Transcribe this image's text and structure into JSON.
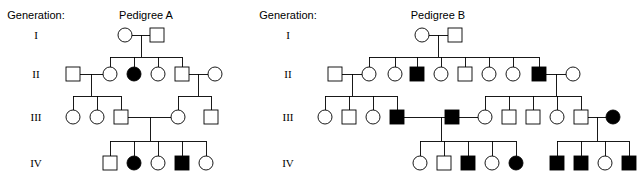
{
  "canvas": {
    "width": 641,
    "height": 186,
    "background": "#ffffff"
  },
  "style": {
    "line_color": "#000000",
    "open_fill": "#ffffff",
    "affected_fill": "#000000",
    "symbol_size": 14,
    "stroke_width": 0.9
  },
  "generation_label_heading": "Generation:",
  "generation_rows": [
    {
      "roman": "I",
      "y": 35
    },
    {
      "roman": "II",
      "y": 74
    },
    {
      "roman": "III",
      "y": 117
    },
    {
      "roman": "IV",
      "y": 163
    }
  ],
  "label_columns": [
    {
      "name": "pedigree-a-generation-labels",
      "heading_x": 36,
      "heading_y": 19,
      "roman_x": 36
    },
    {
      "name": "pedigree-b-generation-labels",
      "heading_x": 288,
      "heading_y": 19,
      "roman_x": 288
    }
  ],
  "pedigrees": [
    {
      "id": "pedigree-a",
      "title": "Pedigree A",
      "title_x": 146,
      "title_y": 19,
      "individuals": [
        {
          "id": "a-I-1",
          "sex": "female",
          "affected": false,
          "cx": 125,
          "cy": 35
        },
        {
          "id": "a-I-2",
          "sex": "male",
          "affected": false,
          "cx": 157,
          "cy": 35
        },
        {
          "id": "a-II-1",
          "sex": "male",
          "affected": false,
          "cx": 73,
          "cy": 74
        },
        {
          "id": "a-II-2",
          "sex": "female",
          "affected": false,
          "cx": 110,
          "cy": 74
        },
        {
          "id": "a-II-3",
          "sex": "female",
          "affected": true,
          "cx": 134,
          "cy": 74
        },
        {
          "id": "a-II-4",
          "sex": "female",
          "affected": false,
          "cx": 158,
          "cy": 74
        },
        {
          "id": "a-II-5",
          "sex": "male",
          "affected": false,
          "cx": 182,
          "cy": 74
        },
        {
          "id": "a-II-6",
          "sex": "female",
          "affected": false,
          "cx": 215,
          "cy": 74
        },
        {
          "id": "a-III-1",
          "sex": "female",
          "affected": false,
          "cx": 73,
          "cy": 117
        },
        {
          "id": "a-III-2",
          "sex": "female",
          "affected": false,
          "cx": 97,
          "cy": 117
        },
        {
          "id": "a-III-3",
          "sex": "male",
          "affected": false,
          "cx": 121,
          "cy": 117
        },
        {
          "id": "a-III-4",
          "sex": "female",
          "affected": false,
          "cx": 178,
          "cy": 117
        },
        {
          "id": "a-III-5",
          "sex": "male",
          "affected": false,
          "cx": 211,
          "cy": 117
        },
        {
          "id": "a-IV-1",
          "sex": "male",
          "affected": false,
          "cx": 110,
          "cy": 163
        },
        {
          "id": "a-IV-2",
          "sex": "female",
          "affected": true,
          "cx": 134,
          "cy": 163
        },
        {
          "id": "a-IV-3",
          "sex": "female",
          "affected": false,
          "cx": 158,
          "cy": 163
        },
        {
          "id": "a-IV-4",
          "sex": "male",
          "affected": true,
          "cx": 182,
          "cy": 163
        },
        {
          "id": "a-IV-5",
          "sex": "female",
          "affected": false,
          "cx": 206,
          "cy": 163
        }
      ],
      "mating_lines": [
        {
          "x1": 132,
          "x2": 150,
          "y": 35
        },
        {
          "x1": 80,
          "x2": 103,
          "y": 74
        },
        {
          "x1": 189,
          "x2": 208,
          "y": 74
        },
        {
          "x1": 128,
          "x2": 171,
          "y": 117
        }
      ],
      "descent_lines": [
        {
          "x": 141,
          "y1": 35,
          "y2": 57
        },
        {
          "x": 91,
          "y1": 74,
          "y2": 96
        },
        {
          "x": 198,
          "y1": 74,
          "y2": 96
        },
        {
          "x": 150,
          "y1": 117,
          "y2": 141
        }
      ],
      "sibship_bars": [
        {
          "y": 57,
          "x1": 110,
          "x2": 182
        },
        {
          "y": 96,
          "x1": 73,
          "x2": 121
        },
        {
          "y": 96,
          "x1": 178,
          "x2": 211
        },
        {
          "y": 141,
          "x1": 110,
          "x2": 206
        }
      ],
      "child_stems": [
        {
          "x": 110,
          "y1": 57,
          "y2": 67
        },
        {
          "x": 134,
          "y1": 57,
          "y2": 67
        },
        {
          "x": 158,
          "y1": 57,
          "y2": 67
        },
        {
          "x": 182,
          "y1": 57,
          "y2": 67
        },
        {
          "x": 73,
          "y1": 96,
          "y2": 110
        },
        {
          "x": 97,
          "y1": 96,
          "y2": 110
        },
        {
          "x": 121,
          "y1": 96,
          "y2": 110
        },
        {
          "x": 178,
          "y1": 96,
          "y2": 110
        },
        {
          "x": 211,
          "y1": 96,
          "y2": 110
        },
        {
          "x": 110,
          "y1": 141,
          "y2": 156
        },
        {
          "x": 134,
          "y1": 141,
          "y2": 156
        },
        {
          "x": 158,
          "y1": 141,
          "y2": 156
        },
        {
          "x": 182,
          "y1": 141,
          "y2": 156
        },
        {
          "x": 206,
          "y1": 141,
          "y2": 156
        }
      ]
    },
    {
      "id": "pedigree-b",
      "title": "Pedigree B",
      "title_x": 438,
      "title_y": 19,
      "individuals": [
        {
          "id": "b-I-1",
          "sex": "female",
          "affected": false,
          "cx": 422,
          "cy": 35
        },
        {
          "id": "b-I-2",
          "sex": "male",
          "affected": false,
          "cx": 455,
          "cy": 35
        },
        {
          "id": "b-II-1",
          "sex": "male",
          "affected": false,
          "cx": 335,
          "cy": 74
        },
        {
          "id": "b-II-2",
          "sex": "female",
          "affected": false,
          "cx": 369,
          "cy": 74
        },
        {
          "id": "b-II-3",
          "sex": "female",
          "affected": false,
          "cx": 395,
          "cy": 74
        },
        {
          "id": "b-II-4",
          "sex": "male",
          "affected": true,
          "cx": 417,
          "cy": 74
        },
        {
          "id": "b-II-5",
          "sex": "female",
          "affected": false,
          "cx": 441,
          "cy": 74
        },
        {
          "id": "b-II-6",
          "sex": "male",
          "affected": false,
          "cx": 465,
          "cy": 74
        },
        {
          "id": "b-II-7",
          "sex": "female",
          "affected": false,
          "cx": 489,
          "cy": 74
        },
        {
          "id": "b-II-8",
          "sex": "female",
          "affected": false,
          "cx": 513,
          "cy": 74
        },
        {
          "id": "b-II-9",
          "sex": "male",
          "affected": true,
          "cx": 539,
          "cy": 74
        },
        {
          "id": "b-II-10",
          "sex": "female",
          "affected": false,
          "cx": 573,
          "cy": 74
        },
        {
          "id": "b-III-1",
          "sex": "female",
          "affected": false,
          "cx": 325,
          "cy": 117
        },
        {
          "id": "b-III-2",
          "sex": "male",
          "affected": false,
          "cx": 349,
          "cy": 117
        },
        {
          "id": "b-III-3",
          "sex": "female",
          "affected": false,
          "cx": 373,
          "cy": 117
        },
        {
          "id": "b-III-4",
          "sex": "male",
          "affected": true,
          "cx": 397,
          "cy": 117
        },
        {
          "id": "b-III-5",
          "sex": "male",
          "affected": true,
          "cx": 452,
          "cy": 117
        },
        {
          "id": "b-III-6",
          "sex": "female",
          "affected": false,
          "cx": 485,
          "cy": 117
        },
        {
          "id": "b-III-7",
          "sex": "male",
          "affected": false,
          "cx": 509,
          "cy": 117
        },
        {
          "id": "b-III-8",
          "sex": "male",
          "affected": false,
          "cx": 533,
          "cy": 117
        },
        {
          "id": "b-III-9",
          "sex": "female",
          "affected": false,
          "cx": 557,
          "cy": 117
        },
        {
          "id": "b-III-10",
          "sex": "male",
          "affected": false,
          "cx": 581,
          "cy": 117
        },
        {
          "id": "b-III-11",
          "sex": "female",
          "affected": true,
          "cx": 613,
          "cy": 117
        },
        {
          "id": "b-IV-1",
          "sex": "female",
          "affected": false,
          "cx": 420,
          "cy": 163
        },
        {
          "id": "b-IV-2",
          "sex": "male",
          "affected": false,
          "cx": 444,
          "cy": 163
        },
        {
          "id": "b-IV-3",
          "sex": "male",
          "affected": true,
          "cx": 468,
          "cy": 163
        },
        {
          "id": "b-IV-4",
          "sex": "female",
          "affected": false,
          "cx": 492,
          "cy": 163
        },
        {
          "id": "b-IV-5",
          "sex": "female",
          "affected": true,
          "cx": 516,
          "cy": 163
        },
        {
          "id": "b-IV-6",
          "sex": "male",
          "affected": true,
          "cx": 557,
          "cy": 163
        },
        {
          "id": "b-IV-7",
          "sex": "male",
          "affected": true,
          "cx": 581,
          "cy": 163
        },
        {
          "id": "b-IV-8",
          "sex": "female",
          "affected": false,
          "cx": 605,
          "cy": 163
        },
        {
          "id": "b-IV-9",
          "sex": "male",
          "affected": true,
          "cx": 629,
          "cy": 163
        }
      ],
      "mating_lines": [
        {
          "x1": 429,
          "x2": 448,
          "y": 35
        },
        {
          "x1": 342,
          "x2": 362,
          "y": 74
        },
        {
          "x1": 546,
          "x2": 566,
          "y": 74
        },
        {
          "x1": 404,
          "x2": 478,
          "y": 117
        },
        {
          "x1": 588,
          "x2": 606,
          "y": 117
        }
      ],
      "descent_lines": [
        {
          "x": 438,
          "y1": 35,
          "y2": 57
        },
        {
          "x": 352,
          "y1": 74,
          "y2": 96
        },
        {
          "x": 556,
          "y1": 74,
          "y2": 96
        },
        {
          "x": 441,
          "y1": 117,
          "y2": 141
        },
        {
          "x": 597,
          "y1": 117,
          "y2": 141
        }
      ],
      "sibship_bars": [
        {
          "y": 57,
          "x1": 369,
          "x2": 539
        },
        {
          "y": 96,
          "x1": 325,
          "x2": 397
        },
        {
          "y": 96,
          "x1": 485,
          "x2": 581
        },
        {
          "y": 141,
          "x1": 420,
          "x2": 516
        },
        {
          "y": 141,
          "x1": 557,
          "x2": 629
        }
      ],
      "child_stems": [
        {
          "x": 369,
          "y1": 57,
          "y2": 67
        },
        {
          "x": 395,
          "y1": 57,
          "y2": 67
        },
        {
          "x": 417,
          "y1": 57,
          "y2": 67
        },
        {
          "x": 441,
          "y1": 57,
          "y2": 67
        },
        {
          "x": 465,
          "y1": 57,
          "y2": 67
        },
        {
          "x": 489,
          "y1": 57,
          "y2": 67
        },
        {
          "x": 513,
          "y1": 57,
          "y2": 67
        },
        {
          "x": 539,
          "y1": 57,
          "y2": 67
        },
        {
          "x": 325,
          "y1": 96,
          "y2": 110
        },
        {
          "x": 349,
          "y1": 96,
          "y2": 110
        },
        {
          "x": 373,
          "y1": 96,
          "y2": 110
        },
        {
          "x": 397,
          "y1": 96,
          "y2": 110
        },
        {
          "x": 485,
          "y1": 96,
          "y2": 110
        },
        {
          "x": 509,
          "y1": 96,
          "y2": 110
        },
        {
          "x": 533,
          "y1": 96,
          "y2": 110
        },
        {
          "x": 557,
          "y1": 96,
          "y2": 110
        },
        {
          "x": 581,
          "y1": 96,
          "y2": 110
        },
        {
          "x": 420,
          "y1": 141,
          "y2": 156
        },
        {
          "x": 444,
          "y1": 141,
          "y2": 156
        },
        {
          "x": 468,
          "y1": 141,
          "y2": 156
        },
        {
          "x": 492,
          "y1": 141,
          "y2": 156
        },
        {
          "x": 516,
          "y1": 141,
          "y2": 156
        },
        {
          "x": 557,
          "y1": 141,
          "y2": 156
        },
        {
          "x": 581,
          "y1": 141,
          "y2": 156
        },
        {
          "x": 605,
          "y1": 141,
          "y2": 156
        },
        {
          "x": 629,
          "y1": 141,
          "y2": 156
        }
      ]
    }
  ]
}
